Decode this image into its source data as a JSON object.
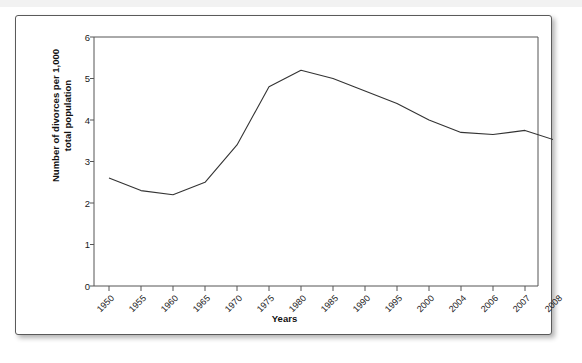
{
  "chart_data": {
    "type": "line",
    "title": "",
    "xlabel": "Years",
    "ylabel": "Number of divorces per 1,000 total population",
    "ylabel_line1": "Number of divorces per 1,000",
    "ylabel_line2": "total population",
    "categories": [
      "1950",
      "1955",
      "1960",
      "1965",
      "1970",
      "1975",
      "1980",
      "1985",
      "1990",
      "1995",
      "2000",
      "2004",
      "2006",
      "2007",
      "2008"
    ],
    "values": [
      2.6,
      2.3,
      2.2,
      2.5,
      3.4,
      4.8,
      5.2,
      5.0,
      4.7,
      4.4,
      4.0,
      3.7,
      3.65,
      3.75,
      3.5
    ],
    "yticks": [
      0,
      1,
      2,
      3,
      4,
      5,
      6
    ],
    "ytick_labels": [
      "0",
      "1",
      "2",
      "3",
      "4",
      "5",
      "6"
    ],
    "ylim": [
      0,
      6
    ],
    "grid": false,
    "legend": "none",
    "line_color": "#333333",
    "axis_color": "#555555",
    "background": "#ffffff"
  },
  "figure": {
    "border_color": "#5a5a5a",
    "shadow": "drop-shadow"
  }
}
